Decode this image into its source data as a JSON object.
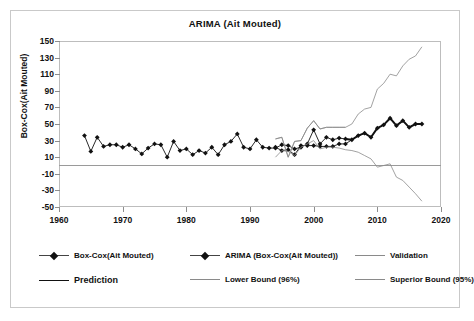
{
  "chart_data": {
    "type": "line",
    "title": "ARIMA (Ait Mouted)",
    "xlabel": "",
    "ylabel": "Box-Cox(Ait Mouted)",
    "xlim": [
      1960,
      2020
    ],
    "ylim": [
      -50,
      150
    ],
    "xticks": [
      1960,
      1970,
      1980,
      1990,
      2000,
      2010,
      2020
    ],
    "yticks": [
      -50,
      -30,
      -10,
      10,
      30,
      50,
      70,
      90,
      110,
      130,
      150
    ],
    "grid": false,
    "legend_position": "bottom",
    "series": [
      {
        "name": "Box-Cox(Ait Mouted)",
        "style": "line-marker",
        "color": "#111111",
        "x": [
          1964,
          1965,
          1966,
          1967,
          1968,
          1969,
          1970,
          1971,
          1972,
          1973,
          1974,
          1975,
          1976,
          1977,
          1978,
          1979,
          1980,
          1981,
          1982,
          1983,
          1984,
          1985,
          1986,
          1987,
          1988,
          1989,
          1990,
          1991,
          1992,
          1993,
          1994,
          1995,
          1996,
          1997,
          1998,
          1999,
          2000,
          2001,
          2002,
          2003,
          2004,
          2005
        ],
        "values": [
          36,
          17,
          34,
          23,
          25,
          25,
          22,
          25,
          20,
          14,
          21,
          26,
          25,
          10,
          29,
          18,
          20,
          13,
          18,
          15,
          22,
          13,
          25,
          29,
          38,
          22,
          20,
          31,
          22,
          21,
          21,
          25,
          24,
          20,
          22,
          26,
          43,
          26,
          34,
          31,
          33,
          32
        ]
      },
      {
        "name": "ARIMA (Box-Cox(Ait Mouted))",
        "style": "line-marker",
        "color": "#111111",
        "x": [
          1994,
          1995,
          1996,
          1997,
          1998,
          1999,
          2000,
          2001,
          2002,
          2003,
          2004,
          2005,
          2006,
          2007,
          2008,
          2009,
          2010,
          2011,
          2012,
          2013,
          2014,
          2015,
          2016,
          2017
        ],
        "values": [
          22,
          18,
          19,
          13,
          24,
          24,
          24,
          23,
          23,
          23,
          26,
          26,
          31,
          36,
          39,
          34,
          45,
          49,
          57,
          48,
          54,
          46,
          50,
          50
        ]
      },
      {
        "name": "Validation",
        "style": "line",
        "color": "#8a8a8a",
        "x": [
          1994,
          1995,
          1996,
          1997,
          1998,
          1999,
          2000,
          2001,
          2002,
          2003,
          2004,
          2005
        ],
        "values": [
          32,
          34,
          10,
          29,
          30,
          45,
          54,
          44,
          46,
          46,
          46,
          46
        ]
      },
      {
        "name": "Prediction",
        "style": "line-thick",
        "color": "#111111",
        "x": [
          2005,
          2006,
          2007,
          2008,
          2009,
          2010,
          2011,
          2012,
          2013,
          2014,
          2015,
          2016,
          2017
        ],
        "values": [
          32,
          31,
          36,
          39,
          34,
          45,
          49,
          57,
          48,
          54,
          46,
          50,
          50
        ]
      },
      {
        "name": "Lower Bound (96%)",
        "style": "line",
        "color": "#8a8a8a",
        "x": [
          1994,
          1995,
          1996,
          1997,
          1998,
          1999,
          2000,
          2001,
          2002,
          2003,
          2004,
          2005,
          2006,
          2007,
          2008,
          2009,
          2010,
          2011,
          2012,
          2013,
          2014,
          2015,
          2016,
          2017
        ],
        "values": [
          10,
          18,
          17,
          12,
          22,
          26,
          30,
          20,
          22,
          22,
          21,
          19,
          18,
          16,
          12,
          8,
          -2,
          0,
          2,
          -14,
          -18,
          -26,
          -34,
          -43
        ]
      },
      {
        "name": "Superior Bound (95%)",
        "style": "line",
        "color": "#8a8a8a",
        "x": [
          1994,
          1995,
          1996,
          1997,
          1998,
          1999,
          2000,
          2001,
          2002,
          2003,
          2004,
          2005,
          2006,
          2007,
          2008,
          2009,
          2010,
          2011,
          2012,
          2013,
          2014,
          2015,
          2016,
          2017
        ],
        "values": [
          32,
          34,
          10,
          29,
          30,
          45,
          54,
          44,
          46,
          46,
          46,
          46,
          50,
          62,
          68,
          70,
          92,
          99,
          110,
          108,
          120,
          128,
          132,
          143
        ]
      }
    ]
  },
  "legend": {
    "items": [
      {
        "label": "Box-Cox(Ait Mouted)",
        "style": "line-marker"
      },
      {
        "label": "ARIMA (Box-Cox(Ait Mouted))",
        "style": "line-marker"
      },
      {
        "label": "Validation",
        "style": "line-thin"
      },
      {
        "label": "Prediction",
        "style": "line-thick"
      },
      {
        "label": "Lower Bound (96%)",
        "style": "line-thin"
      },
      {
        "label": "Superior Bound (95%)",
        "style": "line-thin"
      }
    ]
  }
}
